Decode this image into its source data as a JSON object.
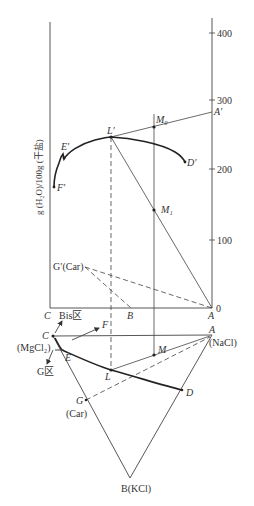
{
  "upper_diagram": {
    "y_axis_title": "g (H₂O)/100g (干盐)",
    "ticks": [
      "0",
      "100",
      "200",
      "300",
      "400"
    ],
    "corner_labels": {
      "C": "C",
      "B": "B",
      "A": "A"
    },
    "points": {
      "A_prime": "A′",
      "L_prime": "L′",
      "M0": "M₀",
      "M1": "M₁",
      "D_prime": "D′",
      "E_prime": "E′",
      "F_prime": "F′",
      "G_prime": "G′(Car)"
    }
  },
  "lower_diagram": {
    "points": {
      "C": "C",
      "C_sub": "(MgCl₂)",
      "A": "A",
      "A_sub": "(NaCl)",
      "B": "B(KCl)",
      "E": "E",
      "L": "L",
      "M": "M",
      "D": "D",
      "G": "G",
      "G_sub": "(Car)",
      "F": "F"
    },
    "regions": {
      "bis": "Bis区",
      "g": "G区"
    }
  },
  "colors": {
    "line": "#333333",
    "background": "#ffffff"
  }
}
